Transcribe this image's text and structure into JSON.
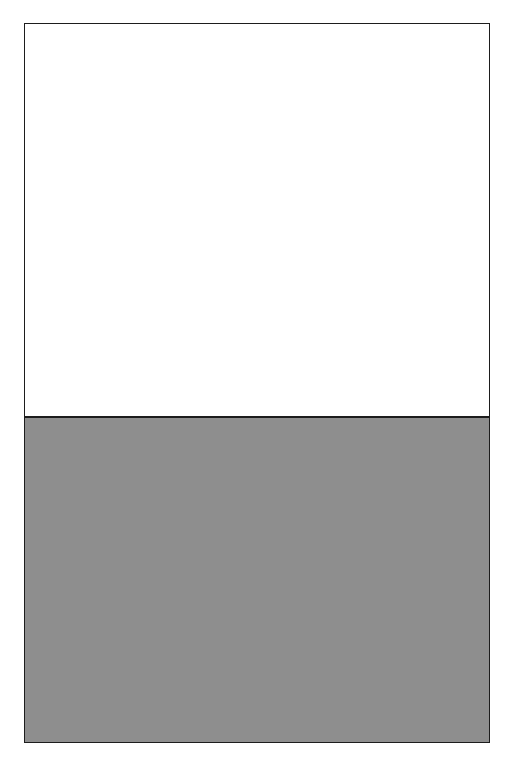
{
  "plate": {
    "title": "Textile pattern plate",
    "background_color": "#ffffff",
    "border_color": "#1d1d1d",
    "frame": {
      "x": 24,
      "y": 23,
      "width": 466,
      "height": 720
    }
  },
  "panels": [
    {
      "id": "panel-top",
      "name": "striped-floral-border-pattern",
      "description": "Vertical striped band pattern with tulip, star-tulip and trailing vine-with-blossom motifs separated by dashed rules",
      "height": 392,
      "colors": {
        "dark_gray": "#4f4f4f",
        "mid_gray": "#787878",
        "light_gray": "#c4c4c4",
        "white": "#ffffff",
        "ink": "#141414",
        "motif_light": "#e8e8e8"
      },
      "repeat_width": 118,
      "vertical_repeat": 65,
      "bands": [
        {
          "name": "dark-tulip-band",
          "fill": "#4f4f4f",
          "motif": "light-tulip",
          "width": 26
        },
        {
          "name": "dashed-rule-band-a",
          "fill": "#ffffff",
          "motif": "dashed-rule",
          "width": 10
        },
        {
          "name": "light-vine-band",
          "fill": "#c4c4c4",
          "motif": "vine-blossom",
          "width": 34
        },
        {
          "name": "dashed-rule-band-b",
          "fill": "#ffffff",
          "motif": "dashed-rule",
          "width": 10
        },
        {
          "name": "mid-star-tulip-band",
          "fill": "#787878",
          "motif": "dark-star-tulip",
          "width": 26
        },
        {
          "name": "dashed-rule-band-c",
          "fill": "#ffffff",
          "motif": "dashed-rule",
          "width": 10
        },
        {
          "name": "white-vine-band",
          "fill": "#ffffff",
          "motif": "vine-blossom",
          "width": 34
        },
        {
          "name": "dashed-rule-band-d",
          "fill": "#ffffff",
          "motif": "dashed-rule",
          "width": 10
        }
      ]
    },
    {
      "id": "panel-bottom",
      "name": "chevron-arrow-stripe-pattern",
      "description": "Vertical columns of stacked chevron-tipped blocks alternating charcoal and mid gray, outlined by pale gray rules",
      "height": 326,
      "colors": {
        "dark_block": "#3c3c3c",
        "mid_block": "#8e8e8e",
        "rule": "#c9c9c9"
      },
      "column_width": 30,
      "column_count": 16,
      "vertical_repeat": 93,
      "chevron_depth": 13,
      "rule_width": 5
    }
  ]
}
